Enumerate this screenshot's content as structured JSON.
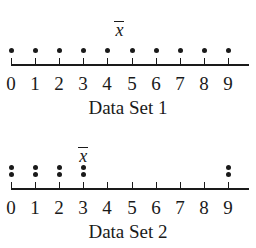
{
  "chart_data": [
    {
      "type": "dot",
      "title": "Data Set 1",
      "xlabel": "Data Set 1",
      "ylabel": "",
      "x_ticks": [
        0,
        1,
        2,
        3,
        4,
        5,
        6,
        7,
        8,
        9
      ],
      "values": [
        0,
        1,
        2,
        3,
        4,
        5,
        6,
        7,
        8,
        9
      ],
      "counts": {
        "0": 1,
        "1": 1,
        "2": 1,
        "3": 1,
        "4": 1,
        "5": 1,
        "6": 1,
        "7": 1,
        "8": 1,
        "9": 1
      },
      "mean": 4.5,
      "mean_label": "x̄",
      "xlim": [
        0,
        9.8
      ],
      "grid": false
    },
    {
      "type": "dot",
      "title": "Data Set 2",
      "xlabel": "Data Set 2",
      "ylabel": "",
      "x_ticks": [
        0,
        1,
        2,
        3,
        4,
        5,
        6,
        7,
        8,
        9
      ],
      "values": [
        0,
        0,
        1,
        1,
        2,
        2,
        3,
        3,
        9,
        9
      ],
      "counts": {
        "0": 2,
        "1": 2,
        "2": 2,
        "3": 2,
        "4": 0,
        "5": 0,
        "6": 0,
        "7": 0,
        "8": 0,
        "9": 2
      },
      "mean": 3,
      "mean_label": "x̄",
      "xlim": [
        0,
        9.8
      ],
      "grid": false
    }
  ],
  "plots": [
    {
      "title": "Data Set 1",
      "mean_symbol": "x",
      "tick_labels": [
        "0",
        "1",
        "2",
        "3",
        "4",
        "5",
        "6",
        "7",
        "8",
        "9"
      ]
    },
    {
      "title": "Data Set 2",
      "mean_symbol": "x",
      "tick_labels": [
        "0",
        "1",
        "2",
        "3",
        "4",
        "5",
        "6",
        "7",
        "8",
        "9"
      ]
    }
  ]
}
